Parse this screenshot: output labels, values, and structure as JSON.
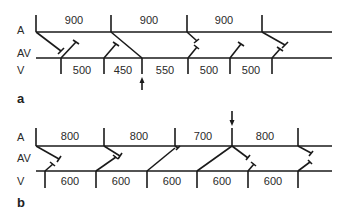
{
  "panels": [
    {
      "id": "a",
      "label": "a",
      "rows": {
        "A": "A",
        "AV": "AV",
        "V": "V"
      },
      "atrial_intervals": [
        {
          "value": "900",
          "x": 74
        },
        {
          "value": "900",
          "x": 149
        },
        {
          "value": "900",
          "x": 224
        }
      ],
      "ventricular_intervals": [
        {
          "value": "500",
          "x": 82
        },
        {
          "value": "450",
          "x": 123
        },
        {
          "value": "550",
          "x": 165
        },
        {
          "value": "500",
          "x": 209
        },
        {
          "value": "500",
          "x": 251
        }
      ],
      "arrow": {
        "direction": "up",
        "position": "below V line at third ventricular beat"
      }
    },
    {
      "id": "b",
      "label": "b",
      "rows": {
        "A": "A",
        "AV": "AV",
        "V": "V"
      },
      "atrial_intervals": [
        {
          "value": "800",
          "x": 70
        },
        {
          "value": "800",
          "x": 139
        },
        {
          "value": "700",
          "x": 203
        },
        {
          "value": "800",
          "x": 265
        }
      ],
      "ventricular_intervals": [
        {
          "value": "600",
          "x": 70
        },
        {
          "value": "600",
          "x": 121
        },
        {
          "value": "600",
          "x": 172
        },
        {
          "value": "600",
          "x": 222
        },
        {
          "value": "600",
          "x": 273
        }
      ],
      "arrow": {
        "direction": "down",
        "position": "above A line at fourth atrial beat"
      }
    }
  ],
  "colors": {
    "ink": "#1a1a1a",
    "background": "#ffffff"
  }
}
